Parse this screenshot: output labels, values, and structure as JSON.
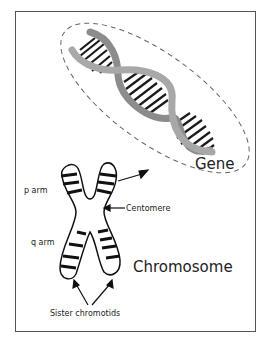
{
  "diagram": {
    "labels": {
      "gene": "Gene",
      "chromosome": "Chromosome",
      "p_arm": "p arm",
      "q_arm": "q arm",
      "centromere": "Centomere",
      "sister_chromatids": "Sister chromotids"
    },
    "colors": {
      "strand": "#a8a8a8",
      "strand_dark": "#8c8c8c",
      "bands": "#1a1a1a",
      "outline": "#111111",
      "frame": "#555555",
      "dashed": "#666666"
    }
  }
}
